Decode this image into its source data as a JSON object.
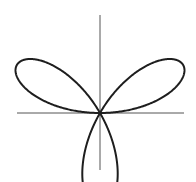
{
  "diagram": {
    "title": "",
    "type": "polar-rose",
    "equation": "r = sin(3θ)",
    "petals": 3,
    "petal_directions_deg": [
      90,
      210,
      330
    ]
  },
  "chart_data": {
    "type": "line",
    "title": "",
    "xlabel": "",
    "ylabel": "",
    "grid": false,
    "legend": [],
    "polar": {
      "k": 3,
      "amplitude": 1,
      "theta_range_deg": [
        0,
        180
      ]
    },
    "xlim": [
      -0.87,
      0.87
    ],
    "ylim": [
      -0.6,
      1.0
    ]
  },
  "render": {
    "origin": {
      "x": 100,
      "y": 113
    },
    "scale_px": 96,
    "x_axis": {
      "x1": 17,
      "x2": 184
    },
    "y_axis": {
      "y1": 15,
      "y2": 170
    },
    "colors": {
      "curve": "#1e1e1e",
      "axis": "#555555",
      "background": "#ffffff"
    }
  }
}
